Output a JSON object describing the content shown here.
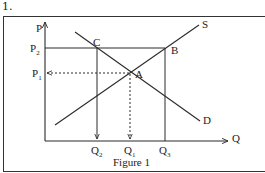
{
  "question_number": "1.",
  "figure": {
    "caption": "Figure 1",
    "axes": {
      "y_label": "P",
      "x_label": "Q"
    },
    "price_labels": {
      "p2": "P",
      "p2_sub": "2",
      "p1": "P",
      "p1_sub": "1"
    },
    "quantity_labels": {
      "q2": "Q",
      "q2_sub": "2",
      "q1": "Q",
      "q1_sub": "1",
      "q3": "Q",
      "q3_sub": "3"
    },
    "points": {
      "a": "A",
      "b": "B",
      "c": "C"
    },
    "curves": {
      "supply": "S",
      "demand": "D"
    }
  },
  "colors": {
    "line": "#2a2a2a",
    "background": "#ffffff"
  }
}
